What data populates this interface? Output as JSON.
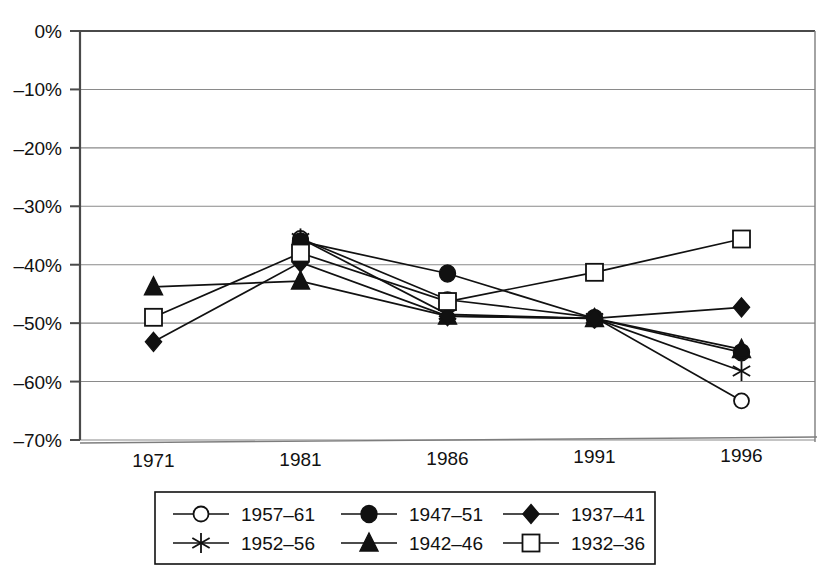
{
  "chart_data": {
    "type": "line",
    "title": "",
    "subtitle": "",
    "xlabel": "",
    "ylabel": "",
    "categories": [
      "1971",
      "1981",
      "1986",
      "1991",
      "1996"
    ],
    "ytick_labels": [
      "0%",
      "-10%",
      "-20%",
      "-30%",
      "-40%",
      "-50%",
      "-60%",
      "-70%"
    ],
    "ytick_values": [
      0,
      -10,
      -20,
      -30,
      -40,
      -50,
      -60,
      -70
    ],
    "ylim": [
      -70,
      0
    ],
    "grid": true,
    "legend_position": "bottom",
    "series": [
      {
        "name": "1957-61",
        "marker": "open-circle",
        "x": [
          "1981",
          "1986",
          "1991",
          "1996"
        ],
        "values": [
          -35.5,
          -46.0,
          -49.0,
          -63.3
        ]
      },
      {
        "name": "1952-56",
        "marker": "asterisk",
        "x": [
          "1981",
          "1986",
          "1991",
          "1996"
        ],
        "values": [
          -35.5,
          -48.5,
          -49.2,
          -58.2
        ]
      },
      {
        "name": "1947-51",
        "marker": "filled-circle",
        "x": [
          "1981",
          "1986",
          "1991",
          "1996"
        ],
        "values": [
          -36.0,
          -41.5,
          -49.2,
          -55.0
        ]
      },
      {
        "name": "1942-46",
        "marker": "filled-triangle",
        "x": [
          "1971",
          "1981",
          "1986",
          "1991",
          "1996"
        ],
        "values": [
          -43.8,
          -42.8,
          -48.8,
          -49.2,
          -54.5
        ]
      },
      {
        "name": "1937-41",
        "marker": "filled-diamond",
        "x": [
          "1971",
          "1981",
          "1986",
          "1991",
          "1996"
        ],
        "values": [
          -53.2,
          -39.6,
          -48.8,
          -49.2,
          -47.3
        ]
      },
      {
        "name": "1932-36",
        "marker": "open-square",
        "x": [
          "1971",
          "1981",
          "1986",
          "1991",
          "1996"
        ],
        "values": [
          -49.0,
          -38.0,
          -46.3,
          -41.3,
          -35.6
        ]
      }
    ]
  },
  "legend": {
    "entries": [
      {
        "label": "1957–61",
        "marker": "open-circle",
        "row": 0,
        "col": 0
      },
      {
        "label": "1947–51",
        "marker": "filled-circle",
        "row": 0,
        "col": 1
      },
      {
        "label": "1937–41",
        "marker": "filled-diamond",
        "row": 0,
        "col": 2
      },
      {
        "label": "1952–56",
        "marker": "asterisk",
        "row": 1,
        "col": 0
      },
      {
        "label": "1942–46",
        "marker": "filled-triangle",
        "row": 1,
        "col": 1
      },
      {
        "label": "1932–36",
        "marker": "open-square",
        "row": 1,
        "col": 2
      }
    ]
  },
  "colors": {
    "ink": "#111111",
    "grid": "#8a8a8a",
    "axis": "#4a4a4a",
    "background": "#ffffff"
  }
}
